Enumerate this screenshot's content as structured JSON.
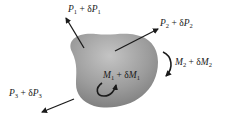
{
  "diagram": {
    "colors": {
      "body_fill_light": "#b5b5b5",
      "body_fill_dark": "#7a7a7a",
      "arrow": "#1a1a1a",
      "background": "#ffffff"
    },
    "loads": [
      {
        "id": "P1",
        "symbol": "P",
        "sub": "1",
        "plus": " + δ",
        "symbol2": "P",
        "sub2": "1",
        "type": "force"
      },
      {
        "id": "P2",
        "symbol": "P",
        "sub": "2",
        "plus": " + δ",
        "symbol2": "P",
        "sub2": "2",
        "type": "force"
      },
      {
        "id": "P3",
        "symbol": "P",
        "sub": "3",
        "plus": " + δ",
        "symbol2": "P",
        "sub2": "3",
        "type": "force"
      },
      {
        "id": "M1",
        "symbol": "M",
        "sub": "1",
        "plus": " + δ",
        "symbol2": "M",
        "sub2": "1",
        "type": "moment"
      },
      {
        "id": "M2",
        "symbol": "M",
        "sub": "2",
        "plus": " + δ",
        "symbol2": "M",
        "sub2": "2",
        "type": "moment"
      }
    ]
  }
}
